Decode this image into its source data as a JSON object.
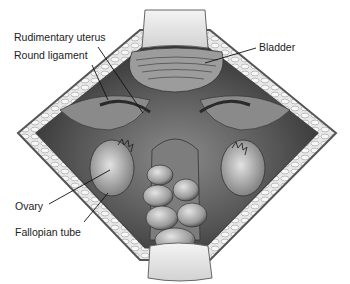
{
  "figure": {
    "type": "anatomical-illustration",
    "view": "Surgical view of open pelvic cavity with retractors",
    "colors": {
      "background": "#ffffff",
      "tissue_dark": "#3a3a3a",
      "tissue_mid": "#7a7a7a",
      "tissue_light": "#c8c8c8",
      "wall_fat": "#e6e6e6",
      "wall_border": "#555555",
      "retractor": "#ececec",
      "label_text": "#222222",
      "leader_line": "#111111"
    }
  },
  "labels": [
    {
      "id": "rudimentary-uterus",
      "text": "Rudimentary uterus",
      "x": 14,
      "y": 32,
      "line": [
        98,
        47,
        143,
        113
      ]
    },
    {
      "id": "round-ligament",
      "text": "Round ligament",
      "x": 14,
      "y": 50,
      "line": [
        92,
        65,
        108,
        100
      ]
    },
    {
      "id": "bladder",
      "text": "Bladder",
      "x": 259,
      "y": 42,
      "line": [
        256,
        48,
        205,
        63
      ]
    },
    {
      "id": "ovary",
      "text": "Ovary",
      "x": 15,
      "y": 201,
      "line": [
        49,
        204,
        110,
        170
      ]
    },
    {
      "id": "fallopian-tube",
      "text": "Fallopian tube",
      "x": 15,
      "y": 227,
      "line": [
        84,
        222,
        108,
        193
      ]
    }
  ]
}
